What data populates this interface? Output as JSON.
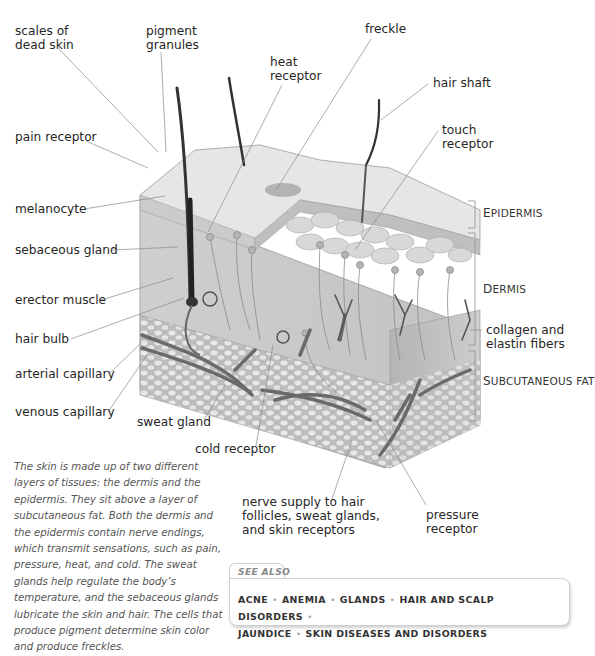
{
  "labels": {
    "left": [
      {
        "id": "scales-of-dead-skin",
        "text": [
          "scales of",
          "dead skin"
        ]
      },
      {
        "id": "pain-receptor",
        "text": [
          "pain receptor"
        ]
      },
      {
        "id": "melanocyte",
        "text": [
          "melanocyte"
        ]
      },
      {
        "id": "sebaceous-gland",
        "text": [
          "sebaceous gland"
        ]
      },
      {
        "id": "erector-muscle",
        "text": [
          "erector muscle"
        ]
      },
      {
        "id": "hair-bulb",
        "text": [
          "hair bulb"
        ]
      },
      {
        "id": "arterial-capillary",
        "text": [
          "arterial capillary"
        ]
      },
      {
        "id": "venous-capillary",
        "text": [
          "venous capillary"
        ]
      }
    ],
    "top": [
      {
        "id": "pigment-granules",
        "text": [
          "pigment",
          "granules"
        ]
      },
      {
        "id": "heat-receptor",
        "text": [
          "heat",
          "receptor"
        ]
      },
      {
        "id": "freckle",
        "text": [
          "freckle"
        ]
      },
      {
        "id": "hair-shaft",
        "text": [
          "hair shaft"
        ]
      },
      {
        "id": "touch-receptor",
        "text": [
          "touch",
          "receptor"
        ]
      }
    ],
    "bottom": [
      {
        "id": "sweat-gland",
        "text": [
          "sweat gland"
        ]
      },
      {
        "id": "cold-receptor",
        "text": [
          "cold receptor"
        ]
      },
      {
        "id": "nerve-supply",
        "text": [
          "nerve supply to hair",
          "follicles, sweat glands,",
          "and skin receptors"
        ]
      },
      {
        "id": "pressure-receptor",
        "text": [
          "pressure",
          "receptor"
        ]
      }
    ],
    "right": [
      {
        "id": "collagen-elastin",
        "text": [
          "collagen and",
          "elastin fibers"
        ]
      }
    ],
    "layers": [
      {
        "id": "epidermis",
        "first": "E",
        "rest": "PIDERMIS"
      },
      {
        "id": "dermis",
        "first": "D",
        "rest": "ERMIS"
      },
      {
        "id": "subcutaneous-fat",
        "first": "S",
        "rest": "UBCUTANEOUS FAT"
      }
    ]
  },
  "caption": "The skin is made up of two different layers of tissues: the dermis and the epidermis. They sit above a layer of subcutaneous fat. Both the dermis and the epidermis contain nerve endings, which transmit sensations, such as pain, pressure, heat, and cold. The sweat glands help regulate the body’s temperature, and the sebaceous glands lubricate the skin and hair. The cells that produce pigment determine skin color and produce freckles.",
  "see_also": {
    "title": "SEE ALSO",
    "links": [
      "ACNE",
      "ANEMIA",
      "GLANDS",
      "HAIR AND SCALP DISORDERS",
      "JAUNDICE",
      "SKIN DISEASES AND DISORDERS"
    ]
  },
  "colors": {
    "skin_top": "#e2e2e2",
    "dermis": "#d0d0d0",
    "fat": "#c4c4c4",
    "vessel": "#6a6a6a",
    "leader": "#8a8a8a"
  }
}
